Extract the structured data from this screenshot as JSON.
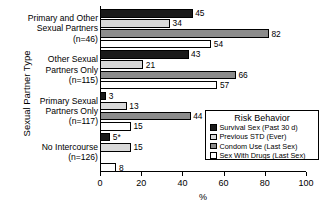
{
  "chart_data": {
    "type": "bar",
    "orientation": "horizontal",
    "title": "",
    "xlabel": "%",
    "ylabel": "Sexual Partner Type",
    "xlim": [
      0,
      100
    ],
    "xticks": [
      0,
      20,
      40,
      60,
      80,
      100
    ],
    "grid": false,
    "legend_title": "Risk Behavior",
    "legend_position": "inside-lower-right",
    "categories": [
      "Primary and Other Sexual Partners (n=46)",
      "Other Sexual Partners Only (n=115)",
      "Primary Sexual Partners Only (n=117)",
      "No Intercourse (n=126)"
    ],
    "category_lines": [
      [
        "Primary and Other",
        "Sexual Partners",
        "(n=46)"
      ],
      [
        "Other Sexual",
        "Partners Only",
        "(n=115)"
      ],
      [
        "Primary Sexual",
        "Partners Only",
        "(n=117)"
      ],
      [
        "No Intercourse",
        "(n=126)"
      ]
    ],
    "series": [
      {
        "name": "Survival Sex (Past 30 d)",
        "color": "#1a1a1a",
        "values": [
          45,
          43,
          3,
          5
        ],
        "labels": [
          "45",
          "43",
          "3",
          "5*"
        ]
      },
      {
        "name": "Previous STD (Ever)",
        "color": "#d9d9d9",
        "values": [
          34,
          21,
          13,
          15
        ],
        "labels": [
          "34",
          "21",
          "13",
          "15"
        ]
      },
      {
        "name": "Condom Use (Last Sex)",
        "color": "#8c8c8c",
        "values": [
          82,
          66,
          44,
          0
        ],
        "labels": [
          "82",
          "66",
          "44",
          ""
        ]
      },
      {
        "name": "Sex With Drugs (Last Sex)",
        "color": "#ffffff",
        "values": [
          54,
          57,
          15,
          8
        ],
        "labels": [
          "54",
          "57",
          "15",
          "8"
        ]
      }
    ]
  },
  "axis": {
    "y_title": "Sexual Partner Type",
    "x_title": "%",
    "x_tick_labels": [
      "0",
      "20",
      "40",
      "60",
      "80",
      "100"
    ]
  },
  "legend": {
    "title": "Risk Behavior",
    "items": [
      {
        "label": "Survival Sex (Past 30 d)",
        "color": "#1a1a1a"
      },
      {
        "label": "Previous STD (Ever)",
        "color": "#d9d9d9"
      },
      {
        "label": "Condom Use (Last Sex)",
        "color": "#8c8c8c"
      },
      {
        "label": "Sex With Drugs (Last Sex)",
        "color": "#ffffff"
      }
    ]
  }
}
